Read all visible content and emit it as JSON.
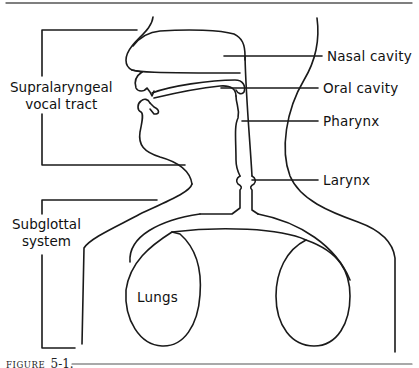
{
  "figure": {
    "caption_word": "FIGURE",
    "caption_number": "5-1.",
    "line_color": "#1a1a1a",
    "background": "#ffffff"
  },
  "brackets": {
    "supralaryngeal": {
      "line1": "Supralaryngeal",
      "line2": "vocal tract"
    },
    "subglottal": {
      "line1": "Subglottal",
      "line2": "system"
    }
  },
  "labels": {
    "nasal_cavity": "Nasal cavity",
    "oral_cavity": "Oral cavity",
    "pharynx": "Pharynx",
    "larynx": "Larynx",
    "lungs": "Lungs"
  }
}
